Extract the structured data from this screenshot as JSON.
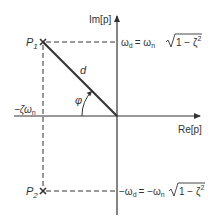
{
  "diagram": {
    "type": "s-plane pole diagram",
    "axes": {
      "imag_label": "Im[p]",
      "real_label": "Re[p]"
    },
    "points": [
      {
        "label": "P",
        "subscript": "1"
      },
      {
        "label": "P",
        "subscript": "2"
      }
    ],
    "labels": {
      "distance": "d",
      "angle": "φ",
      "real_part": "−ζω",
      "real_part_sub": "n",
      "upper_eq_lhs": "ω",
      "upper_eq_lhs_sub": "d",
      "upper_eq_rhs": "= ω",
      "upper_eq_rhs_sub": "n",
      "upper_eq_root": "1 − ζ",
      "upper_eq_root_sup": "2",
      "lower_eq_lhs": "−ω",
      "lower_eq_lhs_sub": "d",
      "lower_eq_rhs": "= −ω",
      "lower_eq_rhs_sub": "n",
      "lower_eq_root": "1 − ζ",
      "lower_eq_root_sup": "2"
    },
    "colors": {
      "ink": "#333333",
      "background": "#ffffff"
    }
  }
}
